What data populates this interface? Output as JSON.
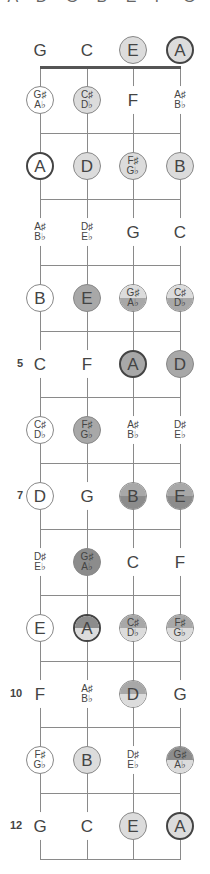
{
  "title": {
    "text": "A D G B E F G",
    "clipped": true
  },
  "colors": {
    "white": "#ffffff",
    "light": "#dcdcdc",
    "medium": "#a8a8a8",
    "dark": "#8c8c8c",
    "line": "#8a8a8a",
    "nut": "#555555"
  },
  "layout": {
    "string_x": [
      40,
      87,
      133,
      180
    ],
    "nut_y": 67,
    "open_y": 50,
    "fret_spacing": 66,
    "num_frets": 12
  },
  "strings": [
    "G",
    "C",
    "E",
    "A"
  ],
  "fret_numbers": [
    {
      "fret": 5,
      "label": "5"
    },
    {
      "fret": 7,
      "label": "7"
    },
    {
      "fret": 10,
      "label": "10"
    },
    {
      "fret": 12,
      "label": "12"
    }
  ],
  "frets": [
    {
      "fret": 0,
      "notes": [
        {
          "sharp": "G",
          "style": "plain"
        },
        {
          "sharp": "C",
          "style": "plain"
        },
        {
          "sharp": "E",
          "style": "light"
        },
        {
          "sharp": "A",
          "style": "light",
          "root": true
        }
      ]
    },
    {
      "fret": 1,
      "notes": [
        {
          "sharp": "G♯",
          "flat": "A♭",
          "style": "white"
        },
        {
          "sharp": "C♯",
          "flat": "D♭",
          "style": "light"
        },
        {
          "sharp": "F",
          "style": "plain"
        },
        {
          "sharp": "A♯",
          "flat": "B♭",
          "style": "plain"
        }
      ]
    },
    {
      "fret": 2,
      "notes": [
        {
          "sharp": "A",
          "style": "white",
          "root": true
        },
        {
          "sharp": "D",
          "style": "light"
        },
        {
          "sharp": "F♯",
          "flat": "G♭",
          "style": "light"
        },
        {
          "sharp": "B",
          "style": "light"
        }
      ]
    },
    {
      "fret": 3,
      "notes": [
        {
          "sharp": "A♯",
          "flat": "B♭",
          "style": "plain"
        },
        {
          "sharp": "D♯",
          "flat": "E♭",
          "style": "plain"
        },
        {
          "sharp": "G",
          "style": "plain"
        },
        {
          "sharp": "C",
          "style": "plain"
        }
      ]
    },
    {
      "fret": 4,
      "notes": [
        {
          "sharp": "B",
          "style": "white"
        },
        {
          "sharp": "E",
          "style": "medium"
        },
        {
          "sharp": "G♯",
          "flat": "A♭",
          "style": "split",
          "top": "light",
          "bottom": "medium"
        },
        {
          "sharp": "C♯",
          "flat": "D♭",
          "style": "split",
          "top": "light",
          "bottom": "medium"
        }
      ]
    },
    {
      "fret": 5,
      "notes": [
        {
          "sharp": "C",
          "style": "plain"
        },
        {
          "sharp": "F",
          "style": "plain"
        },
        {
          "sharp": "A",
          "style": "medium",
          "root": true
        },
        {
          "sharp": "D",
          "style": "medium"
        }
      ]
    },
    {
      "fret": 6,
      "notes": [
        {
          "sharp": "C♯",
          "flat": "D♭",
          "style": "white"
        },
        {
          "sharp": "F♯",
          "flat": "G♭",
          "style": "medium"
        },
        {
          "sharp": "A♯",
          "flat": "B♭",
          "style": "plain"
        },
        {
          "sharp": "D♯",
          "flat": "E♭",
          "style": "plain"
        }
      ]
    },
    {
      "fret": 7,
      "notes": [
        {
          "sharp": "D",
          "style": "white"
        },
        {
          "sharp": "G",
          "style": "plain"
        },
        {
          "sharp": "B",
          "style": "split",
          "top": "medium",
          "bottom": "dark"
        },
        {
          "sharp": "E",
          "style": "split",
          "top": "medium",
          "bottom": "dark"
        }
      ]
    },
    {
      "fret": 8,
      "notes": [
        {
          "sharp": "D♯",
          "flat": "E♭",
          "style": "plain"
        },
        {
          "sharp": "G♯",
          "flat": "A♭",
          "style": "dark"
        },
        {
          "sharp": "C",
          "style": "plain"
        },
        {
          "sharp": "F",
          "style": "plain"
        }
      ]
    },
    {
      "fret": 9,
      "notes": [
        {
          "sharp": "E",
          "style": "white"
        },
        {
          "sharp": "A",
          "style": "split",
          "top": "dark",
          "bottom": "light",
          "root": true
        },
        {
          "sharp": "C♯",
          "flat": "D♭",
          "style": "split",
          "top": "medium",
          "bottom": "light"
        },
        {
          "sharp": "F♯",
          "flat": "G♭",
          "style": "split",
          "top": "medium",
          "bottom": "light"
        }
      ]
    },
    {
      "fret": 10,
      "notes": [
        {
          "sharp": "F",
          "style": "plain"
        },
        {
          "sharp": "A♯",
          "flat": "B♭",
          "style": "plain"
        },
        {
          "sharp": "D",
          "style": "split",
          "top": "medium",
          "bottom": "light"
        },
        {
          "sharp": "G",
          "style": "plain"
        }
      ]
    },
    {
      "fret": 11,
      "notes": [
        {
          "sharp": "F♯",
          "flat": "G♭",
          "style": "white"
        },
        {
          "sharp": "B",
          "style": "light"
        },
        {
          "sharp": "D♯",
          "flat": "E♭",
          "style": "plain"
        },
        {
          "sharp": "G♯",
          "flat": "A♭",
          "style": "split",
          "top": "dark",
          "bottom": "light"
        }
      ]
    },
    {
      "fret": 12,
      "notes": [
        {
          "sharp": "G",
          "style": "plain"
        },
        {
          "sharp": "C",
          "style": "plain"
        },
        {
          "sharp": "E",
          "style": "light"
        },
        {
          "sharp": "A",
          "style": "light",
          "root": true
        }
      ]
    }
  ]
}
